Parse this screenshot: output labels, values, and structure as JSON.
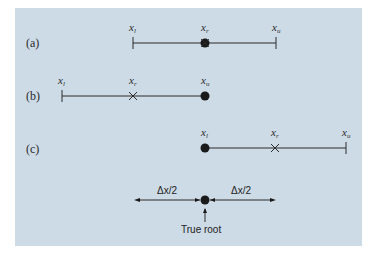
{
  "rows": [
    {
      "label": "(a)",
      "xl": "x",
      "xl_sub": "l",
      "xr": "x",
      "xr_sub": "r",
      "xu": "x",
      "xu_sub": "u"
    },
    {
      "label": "(b)",
      "xl": "x",
      "xl_sub": "l",
      "xr": "x",
      "xr_sub": "r",
      "xu": "x",
      "xu_sub": "u"
    },
    {
      "label": "(c)",
      "xl": "x",
      "xl_sub": "l",
      "xr": "x",
      "xr_sub": "r",
      "xu": "x",
      "xu_sub": "u"
    }
  ],
  "bottom": {
    "left_label": "Δx/2",
    "right_label": "Δx/2",
    "root_label": "True root"
  },
  "colors": {
    "panel": "#cddbe7",
    "ink": "#2a2a2a"
  }
}
